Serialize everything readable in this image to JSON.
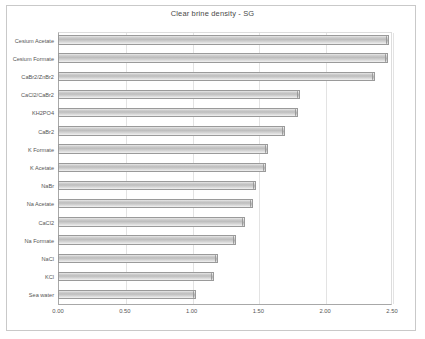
{
  "chart_data": {
    "type": "bar",
    "orientation": "horizontal",
    "title": "Clear brine density - SG",
    "xlabel": "",
    "ylabel": "",
    "xlim": [
      0.0,
      2.5
    ],
    "xticks": [
      "0.00",
      "0.50",
      "1.00",
      "1.50",
      "2.00",
      "2.50"
    ],
    "xtick_values": [
      0.0,
      0.5,
      1.0,
      1.5,
      2.0,
      2.5
    ],
    "grid": true,
    "grid_axis": "x",
    "legend": false,
    "categories": [
      "Cesium Acetate",
      "Cesium Formate",
      "CaBr2/ZnBr2",
      "CaCl2/CaBr2",
      "KH2PO4",
      "CaBr2",
      "K Formate",
      "K Acetate",
      "NaBr",
      "Na Acetate",
      "CaCl2",
      "Na Formate",
      "NaCl",
      "KCl",
      "Sea water"
    ],
    "values": [
      2.48,
      2.47,
      2.37,
      1.81,
      1.8,
      1.7,
      1.57,
      1.56,
      1.48,
      1.46,
      1.4,
      1.33,
      1.2,
      1.17,
      1.03
    ],
    "bar_color": "#c6c6c6",
    "bar_edge_color": "#9a9a9a",
    "background_color": "#ffffff",
    "axis_color": "#a8a8a8",
    "grid_color": "#e3e3e3",
    "text_color": "#555555"
  }
}
